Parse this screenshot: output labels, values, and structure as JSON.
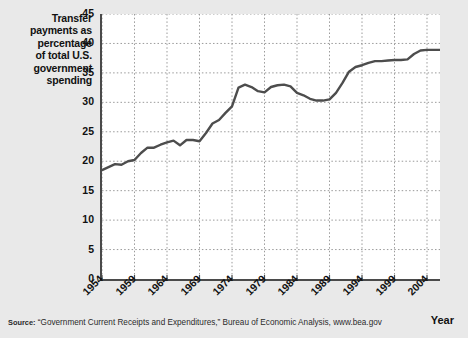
{
  "figure": {
    "background_color": "#e9e9e9",
    "plot_background_color": "#ffffff",
    "axis_color": "#4a4a4a",
    "grid_color": "#9a9a9a",
    "line_color": "#4d4d4d"
  },
  "y_axis_caption": [
    "Transfer",
    "payments as",
    "percentage",
    "of total U.S.",
    "government",
    "spending"
  ],
  "x_axis_title": "Year",
  "source": {
    "label": "Source:",
    "text": " “Government Current Receipts and Expenditures,” Bureau of Economic Analysis, www.bea.gov"
  },
  "chart_data": {
    "type": "line",
    "title": "Transfer payments as percentage of total U.S. government spending",
    "xlabel": "Year",
    "ylabel": "Transfer payments as percentage of total U.S. government spending",
    "xlim": [
      1954,
      2006
    ],
    "ylim": [
      0,
      45
    ],
    "ytick_labels": [
      "0",
      "5",
      "10",
      "15",
      "20",
      "25",
      "30",
      "35",
      "40",
      "45"
    ],
    "yticks": [
      0,
      5,
      10,
      15,
      20,
      25,
      30,
      35,
      40,
      45
    ],
    "xtick_labels": [
      "1954",
      "1959",
      "1964",
      "1969",
      "1974",
      "1979",
      "1984",
      "1989",
      "1994",
      "1999",
      "2004"
    ],
    "xticks": [
      1954,
      1959,
      1964,
      1969,
      1974,
      1979,
      1984,
      1989,
      1994,
      1999,
      2004
    ],
    "grid": true,
    "grid_style": "dotted",
    "legend": false,
    "series": [
      {
        "name": "Transfer payments as percentage of total U.S. government spending",
        "x": [
          1954,
          1955,
          1956,
          1957,
          1958,
          1959,
          1960,
          1961,
          1962,
          1963,
          1964,
          1965,
          1966,
          1967,
          1968,
          1969,
          1970,
          1971,
          1972,
          1973,
          1974,
          1975,
          1976,
          1977,
          1978,
          1979,
          1980,
          1981,
          1982,
          1983,
          1984,
          1985,
          1986,
          1987,
          1988,
          1989,
          1990,
          1991,
          1992,
          1993,
          1994,
          1995,
          1996,
          1997,
          1998,
          1999,
          2000,
          2001,
          2002,
          2003,
          2004,
          2005,
          2006
        ],
        "values": [
          18.5,
          19.0,
          19.5,
          19.4,
          20.0,
          20.2,
          21.4,
          22.3,
          22.3,
          22.8,
          23.2,
          23.5,
          22.7,
          23.6,
          23.6,
          23.4,
          24.8,
          26.4,
          27.0,
          28.2,
          29.3,
          32.5,
          33.0,
          32.6,
          31.9,
          31.7,
          32.6,
          32.9,
          33.0,
          32.7,
          31.6,
          31.2,
          30.6,
          30.3,
          30.3,
          30.5,
          31.6,
          33.3,
          35.2,
          36.0,
          36.3,
          36.7,
          37.0,
          37.0,
          37.1,
          37.2,
          37.2,
          37.3,
          38.2,
          38.8,
          38.9,
          38.9,
          38.9
        ]
      }
    ]
  }
}
